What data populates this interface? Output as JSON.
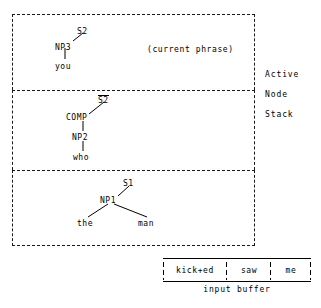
{
  "diagram": {
    "stack_label": {
      "line1": "Active",
      "line2": "Node",
      "line3": "Stack"
    },
    "annotation": {
      "current_phrase": "(current phrase)"
    },
    "panels": [
      {
        "id": "panel-1",
        "nodes": [
          {
            "id": "n-s2",
            "label": "S2",
            "overline": false,
            "x": 77,
            "y": 27
          },
          {
            "id": "n-np3",
            "label": "NP3",
            "overline": false,
            "x": 55,
            "y": 43
          },
          {
            "id": "n-you",
            "label": "you",
            "overline": false,
            "x": 57,
            "y": 65
          }
        ],
        "edges": [
          {
            "from": "n-np3",
            "to": "n-s2",
            "type": "diagonal",
            "x1": 73,
            "y1": 41,
            "x2": 83,
            "y2": 33
          },
          {
            "from": "n-np3",
            "to": "n-you",
            "type": "vertical",
            "x1": 65,
            "y1": 48,
            "x2": 65,
            "y2": 59
          }
        ]
      },
      {
        "id": "panel-2",
        "nodes": [
          {
            "id": "n-sbar2",
            "label": "S2",
            "overline": true,
            "x": 98,
            "y": 96
          },
          {
            "id": "n-comp",
            "label": "COMP",
            "overline": false,
            "x": 67,
            "y": 116
          },
          {
            "id": "n-np2",
            "label": "NP2",
            "overline": false,
            "x": 73,
            "y": 136
          },
          {
            "id": "n-who",
            "label": "who",
            "overline": false,
            "x": 75,
            "y": 156
          }
        ],
        "edges": [
          {
            "from": "n-comp",
            "to": "n-sbar2",
            "type": "diagonal",
            "x1": 89,
            "y1": 114,
            "x2": 103,
            "y2": 103
          },
          {
            "from": "n-comp",
            "to": "n-np2",
            "type": "vertical",
            "x1": 83,
            "y1": 121,
            "x2": 83,
            "y2": 132
          },
          {
            "from": "n-np2",
            "to": "n-who",
            "type": "vertical",
            "x1": 83,
            "y1": 141,
            "x2": 83,
            "y2": 152
          }
        ]
      },
      {
        "id": "panel-3",
        "nodes": [
          {
            "id": "n-s1",
            "label": "S1",
            "overline": false,
            "x": 122,
            "y": 180
          },
          {
            "id": "n-np1",
            "label": "NP1",
            "overline": false,
            "x": 101,
            "y": 198
          },
          {
            "id": "n-the",
            "label": "the",
            "overline": false,
            "x": 78,
            "y": 222
          },
          {
            "id": "n-man",
            "label": "man",
            "overline": false,
            "x": 139,
            "y": 222
          }
        ],
        "edges": [
          {
            "from": "n-np1",
            "to": "n-s1",
            "type": "diagonal",
            "x1": 118,
            "y1": 196,
            "x2": 128,
            "y2": 187
          },
          {
            "from": "n-np1",
            "to": "n-the",
            "type": "diagonal",
            "x1": 108,
            "y1": 203,
            "x2": 87,
            "y2": 216
          },
          {
            "from": "n-np1",
            "to": "n-man",
            "type": "diagonal",
            "x1": 113,
            "y1": 203,
            "x2": 146,
            "y2": 216
          }
        ]
      }
    ],
    "input_buffer": {
      "label": "input buffer",
      "cells": [
        {
          "id": "cell-0",
          "text": "kick+ed"
        },
        {
          "id": "cell-1",
          "text": "saw"
        },
        {
          "id": "cell-2",
          "text": "me"
        }
      ]
    },
    "colors": {
      "ink": "#000000",
      "background": "#ffffff",
      "border": "#1a1a1a"
    }
  }
}
